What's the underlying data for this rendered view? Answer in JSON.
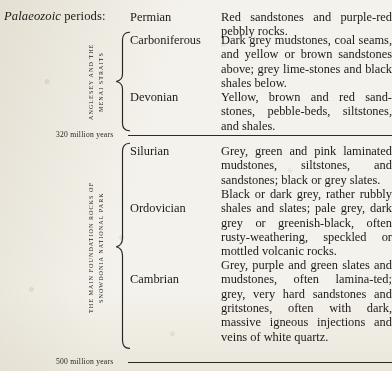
{
  "page": {
    "header": {
      "emphasis": "Palaeozoic",
      "rest": " periods:"
    },
    "groups": [
      {
        "side_caption_lines": [
          "ANGLESEY AND THE",
          "MENAI STRAITS"
        ],
        "side_caption_text": "ANGLESEY AND THE MENAI STRAITS",
        "braced": true,
        "rows": [
          {
            "period": "Carboniferous",
            "description": "Dark grey mudstones, coal seams, and yellow or brown sandstones above; grey lime-stones and black shales below."
          },
          {
            "period": "Devonian",
            "description": "Yellow, brown and red sand-stones, pebble-beds, siltstones, and shales."
          }
        ]
      },
      {
        "side_caption_lines": [
          "THE MAIN FOUNDATION ROCKS OF",
          "SNOWDONIA NATIONAL PARK"
        ],
        "side_caption_text": "THE MAIN FOUNDATION ROCKS OF SNOWDONIA NATIONAL PARK",
        "braced": true,
        "rows": [
          {
            "period": "Silurian",
            "description": "Grey, green and pink laminated mudstones, siltstones, and sandstones; black or grey slates."
          },
          {
            "period": "Ordovician",
            "description": "Black or dark grey, rather rubbly shales and slates; pale grey, dark grey or greenish-black, often rusty-weathering, speckled or mottled volcanic rocks."
          },
          {
            "period": "Cambrian",
            "description": "Grey, purple and green slates and mudstones, often lamina-ted; grey, very hard sandstones and gritstones, often with dark, massive igneous injections and veins of white quartz."
          }
        ]
      }
    ],
    "ungrouped_row": {
      "period": "Permian",
      "description": "Red sandstones and purple-red pebbly rocks."
    },
    "epoch_markers": [
      {
        "label": "320 million years"
      },
      {
        "label": "500 million years"
      }
    ]
  }
}
